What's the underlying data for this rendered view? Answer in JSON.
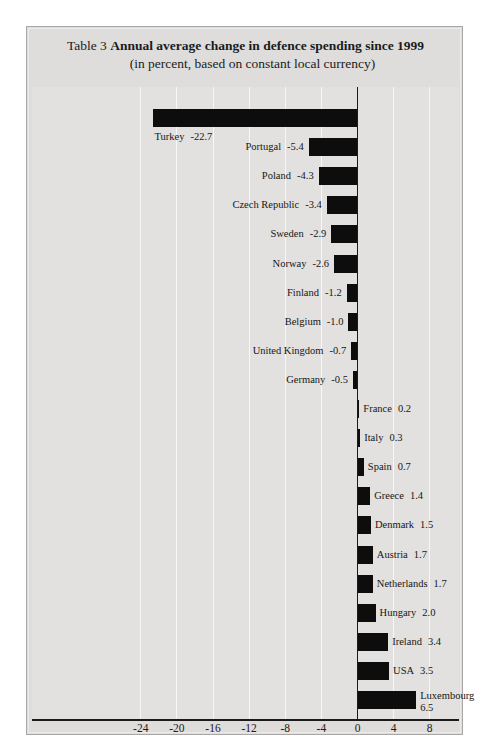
{
  "header": {
    "table_label": "Table 3",
    "title": "Annual average change in defence spending since 1999",
    "subtitle": "(in percent, based on constant local currency)"
  },
  "colors": {
    "bar": "#0d0d0d",
    "plot_background": "#e2e1df",
    "panel_background": "#dedddb",
    "gridline": "#f7f7f6",
    "axis": "#1a1a1a",
    "text": "#1b1b1b"
  },
  "chart_data": {
    "type": "bar",
    "orientation": "horizontal",
    "title": "Annual average change in defence spending since 1999",
    "subtitle": "(in percent, based on constant local currency)",
    "xlabel": "",
    "ylabel": "",
    "xlim": [
      -26,
      9
    ],
    "xticks": [
      -24,
      -20,
      -16,
      -12,
      -8,
      -4,
      0,
      4,
      8
    ],
    "xtick_labels": [
      "-24",
      "-20",
      "-16",
      "-12",
      "-8",
      "-4",
      "0",
      "4",
      "8"
    ],
    "grid": true,
    "legend": "none",
    "categories": [
      "Turkey",
      "Portugal",
      "Poland",
      "Czech Republic",
      "Sweden",
      "Norway",
      "Finland",
      "Belgium",
      "United Kingdom",
      "Germany",
      "France",
      "Italy",
      "Spain",
      "Greece",
      "Denmark",
      "Austria",
      "Netherlands",
      "Hungary",
      "Ireland",
      "USA",
      "Luxembourg"
    ],
    "values": [
      -22.7,
      -5.4,
      -4.3,
      -3.4,
      -2.9,
      -2.6,
      -1.2,
      -1.0,
      -0.7,
      -0.5,
      0.2,
      0.3,
      0.7,
      1.4,
      1.5,
      1.7,
      1.7,
      2.0,
      3.4,
      3.5,
      6.5
    ],
    "value_labels": [
      "-22.7",
      "-5.4",
      "-4.3",
      "-3.4",
      "-2.9",
      "-2.6",
      "-1.2",
      "-1.0",
      "-0.7",
      "-0.5",
      "0.2",
      "0.3",
      "0.7",
      "1.4",
      "1.5",
      "1.7",
      "1.7",
      "2.0",
      "3.4",
      "3.5",
      "6.5"
    ],
    "bars": [
      {
        "name": "Turkey",
        "value": -22.7,
        "label": "Turkey",
        "value_label": "-22.7",
        "label_side": "below-left",
        "wrap": false
      },
      {
        "name": "Portugal",
        "value": -5.4,
        "label": "Portugal",
        "value_label": "-5.4",
        "label_side": "left",
        "wrap": false
      },
      {
        "name": "Poland",
        "value": -4.3,
        "label": "Poland",
        "value_label": "-4.3",
        "label_side": "left",
        "wrap": false
      },
      {
        "name": "Czech Republic",
        "value": -3.4,
        "label": "Czech Republic",
        "value_label": "-3.4",
        "label_side": "left",
        "wrap": false
      },
      {
        "name": "Sweden",
        "value": -2.9,
        "label": "Sweden",
        "value_label": "-2.9",
        "label_side": "left",
        "wrap": false
      },
      {
        "name": "Norway",
        "value": -2.6,
        "label": "Norway",
        "value_label": "-2.6",
        "label_side": "left",
        "wrap": false
      },
      {
        "name": "Finland",
        "value": -1.2,
        "label": "Finland",
        "value_label": "-1.2",
        "label_side": "left",
        "wrap": false
      },
      {
        "name": "Belgium",
        "value": -1.0,
        "label": "Belgium",
        "value_label": "-1.0",
        "label_side": "left",
        "wrap": false
      },
      {
        "name": "United Kingdom",
        "value": -0.7,
        "label": "United Kingdom",
        "value_label": "-0.7",
        "label_side": "left",
        "wrap": false
      },
      {
        "name": "Germany",
        "value": -0.5,
        "label": "Germany",
        "value_label": "-0.5",
        "label_side": "left",
        "wrap": false
      },
      {
        "name": "France",
        "value": 0.2,
        "label": "France",
        "value_label": "0.2",
        "label_side": "right",
        "wrap": false
      },
      {
        "name": "Italy",
        "value": 0.3,
        "label": "Italy",
        "value_label": "0.3",
        "label_side": "right",
        "wrap": false
      },
      {
        "name": "Spain",
        "value": 0.7,
        "label": "Spain",
        "value_label": "0.7",
        "label_side": "right",
        "wrap": false
      },
      {
        "name": "Greece",
        "value": 1.4,
        "label": "Greece",
        "value_label": "1.4",
        "label_side": "right",
        "wrap": false
      },
      {
        "name": "Denmark",
        "value": 1.5,
        "label": "Denmark",
        "value_label": "1.5",
        "label_side": "right",
        "wrap": false
      },
      {
        "name": "Austria",
        "value": 1.7,
        "label": "Austria",
        "value_label": "1.7",
        "label_side": "right",
        "wrap": false
      },
      {
        "name": "Netherlands",
        "value": 1.7,
        "label": "Netherlands",
        "value_label": "1.7",
        "label_side": "right",
        "wrap": false
      },
      {
        "name": "Hungary",
        "value": 2.0,
        "label": "Hungary",
        "value_label": "2.0",
        "label_side": "right",
        "wrap": false
      },
      {
        "name": "Ireland",
        "value": 3.4,
        "label": "Ireland",
        "value_label": "3.4",
        "label_side": "right",
        "wrap": false
      },
      {
        "name": "USA",
        "value": 3.5,
        "label": "USA",
        "value_label": "3.5",
        "label_side": "right",
        "wrap": false
      },
      {
        "name": "Luxembourg",
        "value": 6.5,
        "label": "Luxembourg",
        "value_label": "6.5",
        "label_side": "right",
        "wrap": true
      }
    ]
  }
}
